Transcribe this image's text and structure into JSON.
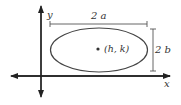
{
  "diagram": {
    "axes": {
      "x_label": "x",
      "y_label": "y"
    },
    "ellipse": {
      "center_label": "(h, k)",
      "major_axis_label": "2 a",
      "minor_axis_label": "2 b"
    },
    "colors": {
      "stroke": "#333333",
      "background": "#ffffff"
    }
  }
}
